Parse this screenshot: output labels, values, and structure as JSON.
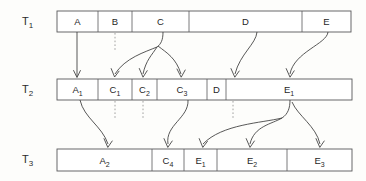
{
  "figure": {
    "kind": "version-lineage-diagram",
    "background_color": "#fdfdfb",
    "line_color": "#3a3a3a",
    "box_stroke_color": "#58585a",
    "stub_color": "#8a8a8a"
  },
  "rows": [
    {
      "id": "t1",
      "label_base": "T",
      "label_sub": "1",
      "label_x": 22,
      "label_y": 25,
      "box": {
        "x": 57,
        "y": 11,
        "width": 294,
        "height": 21
      },
      "cells": [
        {
          "name": "cell-a",
          "base": "A",
          "sub": "",
          "x": 57,
          "width": 41
        },
        {
          "name": "cell-b",
          "base": "B",
          "sub": "",
          "x": 98,
          "width": 34
        },
        {
          "name": "cell-c",
          "base": "C",
          "sub": "",
          "x": 132,
          "width": 57
        },
        {
          "name": "cell-d",
          "base": "D",
          "sub": "",
          "x": 189,
          "width": 113
        },
        {
          "name": "cell-e",
          "base": "E",
          "sub": "",
          "x": 302,
          "width": 49
        }
      ]
    },
    {
      "id": "t2",
      "label_base": "T",
      "label_sub": "2",
      "label_x": 22,
      "label_y": 93,
      "box": {
        "x": 57,
        "y": 79,
        "width": 295,
        "height": 21
      },
      "cells": [
        {
          "name": "cell-a1",
          "base": "A",
          "sub": "1",
          "x": 57,
          "width": 41
        },
        {
          "name": "cell-c1",
          "base": "C",
          "sub": "1",
          "x": 98,
          "width": 34
        },
        {
          "name": "cell-c2",
          "base": "C",
          "sub": "2",
          "x": 132,
          "width": 25
        },
        {
          "name": "cell-c3",
          "base": "C",
          "sub": "3",
          "x": 157,
          "width": 50
        },
        {
          "name": "cell-d",
          "base": "D",
          "sub": "",
          "x": 207,
          "width": 19
        },
        {
          "name": "cell-e1",
          "base": "E",
          "sub": "1",
          "x": 226,
          "width": 126
        }
      ]
    },
    {
      "id": "t3",
      "label_base": "T",
      "label_sub": "3",
      "label_x": 22,
      "label_y": 163,
      "box": {
        "x": 57,
        "y": 149,
        "width": 295,
        "height": 22
      },
      "cells": [
        {
          "name": "cell-a2",
          "base": "A",
          "sub": "2",
          "x": 57,
          "width": 95
        },
        {
          "name": "cell-c4",
          "base": "C",
          "sub": "4",
          "x": 152,
          "width": 32
        },
        {
          "name": "cell-e1",
          "base": "E",
          "sub": "1",
          "x": 184,
          "width": 33
        },
        {
          "name": "cell-e2",
          "base": "E",
          "sub": "2",
          "x": 217,
          "width": 70
        },
        {
          "name": "cell-e3",
          "base": "E",
          "sub": "3",
          "x": 287,
          "width": 65
        }
      ]
    }
  ],
  "edges": [
    {
      "name": "edge-a-to-a1",
      "from": "A",
      "to": "A1",
      "kind": "solid",
      "path": "M 77,32 L 77,76",
      "head": "M 73.6,70.5 L 77,77.5 L 80.4,70.5"
    },
    {
      "name": "edge-b-stub",
      "from": "B",
      "to": "",
      "kind": "stub",
      "path": "M 115,33 L 115,52",
      "head": ""
    },
    {
      "name": "edge-c-trunk",
      "from": "C",
      "to": "",
      "kind": "solid",
      "path": "M 163,32 C 163,40 161,44 157,47",
      "head": ""
    },
    {
      "name": "edge-c-to-c1",
      "from": "C",
      "to": "C1",
      "kind": "solid",
      "path": "M 157,47 C 145,52 125,58 115,74",
      "head": "M 111.2,68.6 L 114.6,77.0 L 119.0,71.2"
    },
    {
      "name": "edge-c-to-c2",
      "from": "C",
      "to": "C2",
      "kind": "solid",
      "path": "M 157,47 C 152,55 146,60 143,74",
      "head": "M 139.3,68.5 L 143.0,77.2 L 147.2,70.7"
    },
    {
      "name": "edge-c-to-c3",
      "from": "C",
      "to": "C3",
      "kind": "solid",
      "path": "M 158,46 C 167,53 176,58 181,74",
      "head": "M 177.0,69.0 L 181.2,77.2 L 185.2,70.0"
    },
    {
      "name": "edge-d-to-d",
      "from": "D",
      "to": "D",
      "kind": "solid",
      "path": "M 257,32 C 256,44 240,54 235,74",
      "head": "M 231.0,68.6 L 234.8,77.2 L 239.2,71.0"
    },
    {
      "name": "edge-e-to-e1",
      "from": "E",
      "to": "E1",
      "kind": "solid",
      "path": "M 328,32 C 327,44 294,52 290,74",
      "head": "M 286.2,68.6 L 290.0,77.2 L 294.2,70.8"
    },
    {
      "name": "edge-a1-to-a2",
      "from": "A1",
      "to": "A2",
      "kind": "solid",
      "path": "M 80,100 C 84,118 102,126 108,144",
      "head": "M 104.0,138.6 L 107.8,147.4 L 112.2,141.0"
    },
    {
      "name": "edge-c1-stub",
      "from": "C1",
      "to": "",
      "kind": "stub",
      "path": "M 115,101 L 115,120",
      "head": ""
    },
    {
      "name": "edge-c2-stub",
      "from": "C2",
      "to": "",
      "kind": "stub",
      "path": "M 143,101 L 143,120",
      "head": ""
    },
    {
      "name": "edge-c3-to-c4",
      "from": "C3",
      "to": "C4",
      "kind": "solid",
      "path": "M 188,100 C 189,118 165,125 168,144",
      "head": "M 164.0,138.6 L 167.8,147.4 L 172.2,141.0"
    },
    {
      "name": "edge-d-stub",
      "from": "D",
      "to": "",
      "kind": "stub",
      "path": "M 233,101 L 233,120",
      "head": ""
    },
    {
      "name": "edge-e1-trunk",
      "from": "E1",
      "to": "",
      "kind": "solid",
      "path": "M 290,100 C 290,108 288,114 282,118",
      "head": ""
    },
    {
      "name": "edge-e1-to-e1",
      "from": "E1",
      "to": "E1",
      "kind": "solid",
      "path": "M 282,118 C 262,123 222,124 203,144",
      "head": "M 199.2,138.6 L 202.8,147.4 L 207.4,141.4"
    },
    {
      "name": "edge-e1-to-e2",
      "from": "E1",
      "to": "E2",
      "kind": "solid",
      "path": "M 282,118 C 272,124 254,126 250,144",
      "head": "M 246.2,138.6 L 250.0,147.4 L 254.4,141.0"
    },
    {
      "name": "edge-e1-to-e3",
      "from": "E1",
      "to": "E3",
      "kind": "solid",
      "path": "M 292,102 C 298,116 316,126 320,144",
      "head": "M 316.0,138.6 L 319.8,147.4 L 324.2,141.0"
    }
  ]
}
